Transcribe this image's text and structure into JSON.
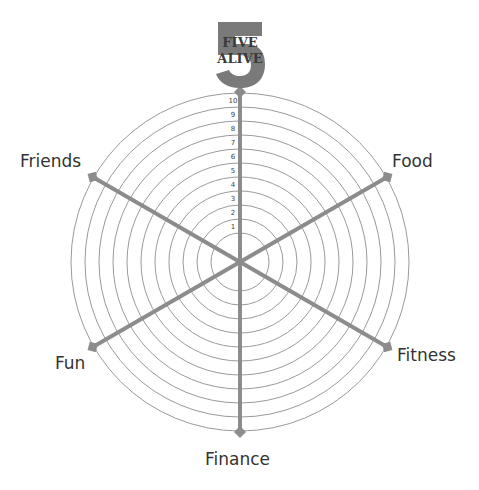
{
  "logo": {
    "line1": "FIVE",
    "line2": "ALIVE",
    "color": "#7a7a7a"
  },
  "wheel": {
    "center": [
      240,
      262
    ],
    "outer_radius": 169,
    "ring_step": 14,
    "ring_count": 11,
    "ring_color": "#9a9a9a",
    "spoke_color": "#8c8c8c",
    "scale_labels": [
      "10",
      "9",
      "8",
      "7",
      "6",
      "5",
      "4",
      "3",
      "2",
      "1"
    ]
  },
  "categories": [
    {
      "label": "Friends",
      "angle": 150
    },
    {
      "label": "Food",
      "angle": 30
    },
    {
      "label": "Fitness",
      "angle": -30
    },
    {
      "label": "Finance",
      "angle": -90
    },
    {
      "label": "Fun",
      "angle": -150
    },
    {
      "label": "Five Alive",
      "angle": 90
    }
  ]
}
